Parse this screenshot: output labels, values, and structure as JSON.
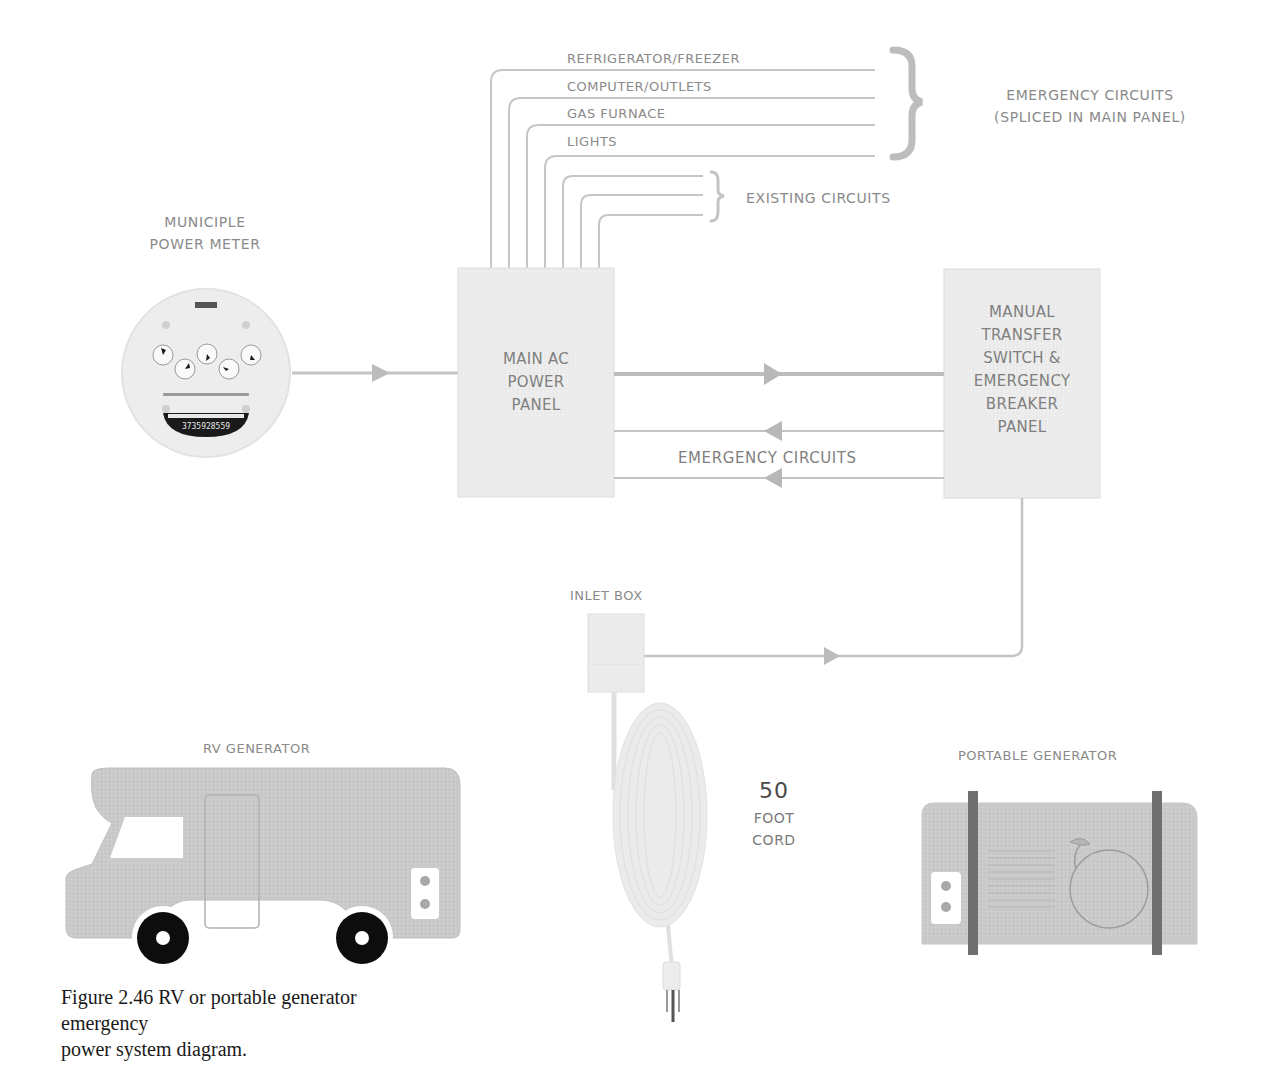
{
  "diagram": {
    "title": "RV or portable generator emergency power system diagram",
    "caption_line1": "Figure 2.46 RV or portable generator emergency",
    "caption_line2": "power system diagram.",
    "meter": {
      "label_line1": "MUNICIPLE",
      "label_line2": "POWER METER",
      "brand": "METER",
      "serial": "3735928559"
    },
    "main_panel": {
      "line1": "MAIN AC",
      "line2": "POWER",
      "line3": "PANEL"
    },
    "transfer_panel": {
      "line1": "MANUAL",
      "line2": "TRANSFER",
      "line3": "SWITCH &",
      "line4": "EMERGENCY",
      "line5": "BREAKER",
      "line6": "PANEL"
    },
    "circuits": {
      "emergency": [
        "REFRIGERATOR/FREEZER",
        "COMPUTER/OUTLETS",
        "GAS FURNACE",
        "LIGHTS"
      ],
      "emergency_group_line1": "EMERGENCY CIRCUITS",
      "emergency_group_line2": "(SPLICED IN MAIN PANEL)",
      "existing_group": "EXISTING CIRCUITS",
      "return_label": "EMERGENCY CIRCUITS"
    },
    "inlet_box": {
      "label": "INLET BOX"
    },
    "cord": {
      "length": "50",
      "line2": "FOOT",
      "line3": "CORD"
    },
    "rv_generator": {
      "label": "RV GENERATOR"
    },
    "portable_generator": {
      "label": "PORTABLE GENERATOR"
    },
    "colors": {
      "line": "#c4c4c4",
      "box_fill": "#ececec",
      "box_stroke": "#d8d8d8",
      "vehicle_fill": "#c9c9c9",
      "wheel": "#0d0d0d",
      "strap": "#6f6f6f",
      "text": "#8a8a8a"
    }
  }
}
